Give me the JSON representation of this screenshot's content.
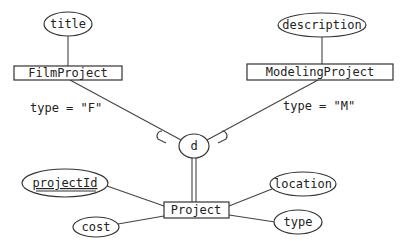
{
  "diagram": {
    "type": "ER diagram (EER specialization)",
    "superclass": {
      "name": "Project",
      "attributes": [
        {
          "name": "projectId",
          "key": true
        },
        {
          "name": "location",
          "key": false
        },
        {
          "name": "type",
          "key": false
        },
        {
          "name": "cost",
          "key": false
        }
      ]
    },
    "specialization": {
      "symbol": "d",
      "constraint": "disjoint",
      "participation": "total",
      "subclasses": [
        {
          "name": "FilmProject",
          "attribute": "title",
          "predicate": "type = \"F\""
        },
        {
          "name": "ModelingProject",
          "attribute": "description",
          "predicate": "type = \"M\""
        }
      ]
    }
  },
  "colors": {
    "stroke": "#333333",
    "background": "#ffffff",
    "text": "#222222"
  }
}
